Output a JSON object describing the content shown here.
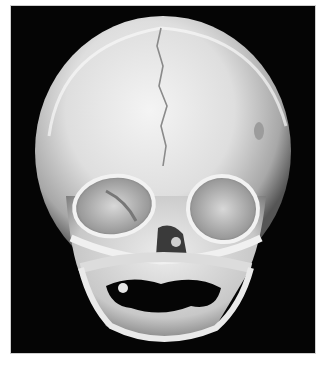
{
  "figure": {
    "background_color": "#050505",
    "bone_color": "#e6e6e6",
    "margin_color": "#ffffff",
    "caption": ""
  }
}
